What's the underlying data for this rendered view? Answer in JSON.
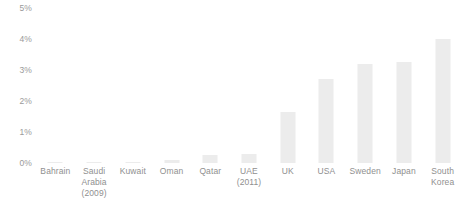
{
  "chart_data": {
    "type": "bar",
    "title": "",
    "subtitle": "",
    "xlabel": "",
    "ylabel": "",
    "ylim": [
      0,
      5
    ],
    "grid": false,
    "legend": "none",
    "value_unit": "%",
    "y_ticks": [
      "5%",
      "4%",
      "3%",
      "2%",
      "1%",
      "0%"
    ],
    "y_tick_values": [
      5,
      4,
      3,
      2,
      1,
      0
    ],
    "categories": [
      "Bahrain",
      "Saudi Arabia (2009)",
      "Kuwait",
      "Oman",
      "Qatar",
      "UAE (2011)",
      "UK",
      "USA",
      "Sweden",
      "Japan",
      "South Korea"
    ],
    "category_label_lines": [
      [
        "Bahrain"
      ],
      [
        "Saudi",
        "Arabia",
        "(2009)"
      ],
      [
        "Kuwait"
      ],
      [
        "Oman"
      ],
      [
        "Qatar"
      ],
      [
        "UAE",
        "(2011)"
      ],
      [
        "UK"
      ],
      [
        "USA"
      ],
      [
        "Sweden"
      ],
      [
        "Japan"
      ],
      [
        "South",
        "Korea"
      ]
    ],
    "values": [
      0.02,
      0.03,
      0.03,
      0.1,
      0.25,
      0.3,
      1.65,
      2.7,
      3.2,
      3.25,
      4.0
    ],
    "colors": {
      "bar_fill": "#ececec",
      "background": "#ffffff",
      "tick_text": "#9a9a9a",
      "category_text": "#8f8f8f"
    }
  }
}
